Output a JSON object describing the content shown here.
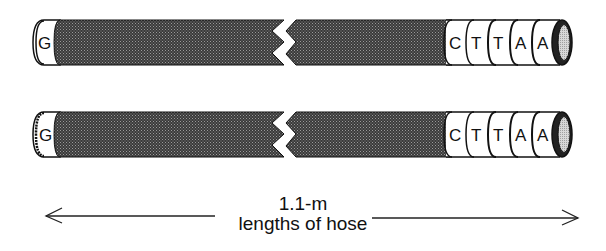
{
  "figure": {
    "hoses": [
      {
        "id": "hose-1",
        "left_band": "G",
        "right_bands": [
          "C",
          "T",
          "T",
          "A",
          "A"
        ],
        "broken_middle": true
      },
      {
        "id": "hose-2",
        "left_band": "G",
        "right_bands": [
          "C",
          "T",
          "T",
          "A",
          "A"
        ],
        "broken_middle": true
      }
    ],
    "dimension": {
      "label_line1": "1.1-m",
      "label_line2": "lengths of hose",
      "arrow": "double-headed"
    },
    "colors": {
      "hose_body": "#4a4a4a",
      "band_fill": "#ffffff",
      "outline": "#111111",
      "end_cap_inner": "#cfcfcf"
    }
  }
}
